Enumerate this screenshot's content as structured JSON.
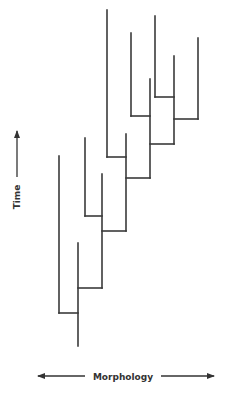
{
  "diagram": {
    "type": "phylogenetic-tree",
    "line_color": "#3a3a3a",
    "axes": {
      "y_label": "Time",
      "x_label": "Morphology",
      "y_direction": "up",
      "x_direction": "both"
    },
    "segments": [
      {
        "x1": 78,
        "y1": 346,
        "x2": 78,
        "y2": 243
      },
      {
        "x1": 59,
        "y1": 313,
        "x2": 78,
        "y2": 313
      },
      {
        "x1": 59,
        "y1": 313,
        "x2": 59,
        "y2": 156
      },
      {
        "x1": 78,
        "y1": 288,
        "x2": 102,
        "y2": 288
      },
      {
        "x1": 102,
        "y1": 288,
        "x2": 102,
        "y2": 174
      },
      {
        "x1": 102,
        "y1": 231,
        "x2": 126,
        "y2": 231
      },
      {
        "x1": 85,
        "y1": 216,
        "x2": 102,
        "y2": 216
      },
      {
        "x1": 85,
        "y1": 216,
        "x2": 85,
        "y2": 138
      },
      {
        "x1": 126,
        "y1": 231,
        "x2": 126,
        "y2": 134
      },
      {
        "x1": 107,
        "y1": 157,
        "x2": 126,
        "y2": 157
      },
      {
        "x1": 107,
        "y1": 157,
        "x2": 107,
        "y2": 10
      },
      {
        "x1": 126,
        "y1": 178,
        "x2": 150,
        "y2": 178
      },
      {
        "x1": 150,
        "y1": 178,
        "x2": 150,
        "y2": 79
      },
      {
        "x1": 131,
        "y1": 116,
        "x2": 150,
        "y2": 116
      },
      {
        "x1": 131,
        "y1": 116,
        "x2": 131,
        "y2": 33
      },
      {
        "x1": 150,
        "y1": 144,
        "x2": 174,
        "y2": 144
      },
      {
        "x1": 174,
        "y1": 144,
        "x2": 174,
        "y2": 56
      },
      {
        "x1": 155,
        "y1": 97,
        "x2": 174,
        "y2": 97
      },
      {
        "x1": 155,
        "y1": 97,
        "x2": 155,
        "y2": 16
      },
      {
        "x1": 174,
        "y1": 119,
        "x2": 198,
        "y2": 119
      },
      {
        "x1": 198,
        "y1": 119,
        "x2": 198,
        "y2": 38
      }
    ]
  }
}
